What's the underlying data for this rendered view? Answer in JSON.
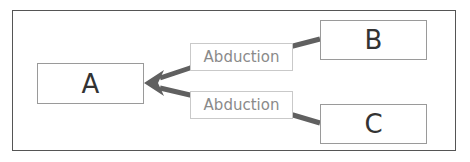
{
  "diagram": {
    "nodes": [
      {
        "id": "A",
        "label": "A"
      },
      {
        "id": "B",
        "label": "B"
      },
      {
        "id": "C",
        "label": "C"
      }
    ],
    "edges": [
      {
        "from": "B",
        "to": "A",
        "label": "Abduction"
      },
      {
        "from": "C",
        "to": "A",
        "label": "Abduction"
      }
    ],
    "colors": {
      "arrow": "#606060",
      "frame": "#555555",
      "node_border": "#9a9a9a",
      "label_text": "#8a8a8a"
    }
  }
}
